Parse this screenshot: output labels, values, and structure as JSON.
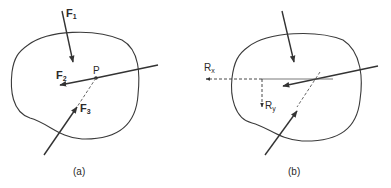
{
  "figure": {
    "panels": [
      {
        "id": "a",
        "caption": "(a)",
        "labels": {
          "f1": {
            "base": "F",
            "sub": "1"
          },
          "f2": {
            "base": "F",
            "sub": "2"
          },
          "f3": {
            "base": "F",
            "sub": "3"
          },
          "point": "P"
        }
      },
      {
        "id": "b",
        "caption": "(b)",
        "labels": {
          "rx": {
            "base": "R",
            "sub": "x"
          },
          "ry": {
            "base": "R",
            "sub": "y"
          }
        }
      }
    ],
    "colors": {
      "stroke": "#3a3a3a",
      "background": "#ffffff"
    }
  }
}
